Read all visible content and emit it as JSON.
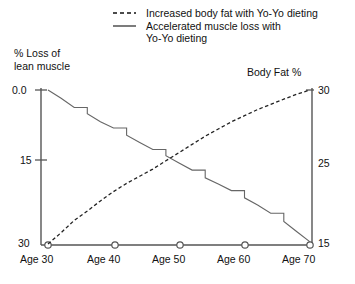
{
  "legend": {
    "position": "top",
    "entries": [
      {
        "label": "Increased body fat with Yo-Yo dieting",
        "style": "dashed",
        "name": "legend-item-body-fat"
      },
      {
        "label": "Accelerated muscle loss with",
        "label2": "Yo-Yo dieting",
        "style": "solid",
        "name": "legend-item-muscle-loss"
      }
    ]
  },
  "axes": {
    "left_title_line1": "% Loss of",
    "left_title_line2": "lean muscle",
    "right_title": "Body Fat %",
    "left_ticks": [
      "0.0",
      "15",
      "30"
    ],
    "right_ticks": [
      "30",
      "25",
      "15"
    ],
    "x_ticks": [
      "Age 30",
      "Age 40",
      "Age 50",
      "Age 60",
      "Age 70"
    ]
  },
  "chart_data": {
    "type": "line",
    "title": "",
    "subtitle": "",
    "xlabel": "",
    "ylabel": "% Loss of lean muscle",
    "y2label": "Body Fat %",
    "grid": false,
    "legend_position": "top",
    "x": [
      30,
      32,
      34,
      36,
      38,
      40,
      42,
      44,
      46,
      48,
      50,
      52,
      54,
      56,
      58,
      60,
      62,
      64,
      66,
      68,
      70
    ],
    "xlim": [
      30,
      70
    ],
    "ylim": [
      30,
      0
    ],
    "y2lim": [
      15,
      30
    ],
    "yticks": [
      0.0,
      15,
      30
    ],
    "y2ticks": [
      15,
      25,
      30
    ],
    "series": [
      {
        "name": "Accelerated muscle loss with Yo-Yo dieting",
        "axis": "left",
        "style": "solid",
        "ylabel": "% Loss of lean muscle",
        "values": [
          0.0,
          1.6,
          3.4,
          4.6,
          6.2,
          7.4,
          8.8,
          10.2,
          11.6,
          12.8,
          14.2,
          15.6,
          17.1,
          18.3,
          19.6,
          21.0,
          22.4,
          24.0,
          25.6,
          27.6,
          29.6
        ]
      },
      {
        "name": "Increased body fat with Yo-Yo dieting",
        "axis": "right",
        "style": "dashed",
        "ylabel": "Body Fat %",
        "values": [
          15.0,
          16.1,
          17.3,
          18.2,
          19.2,
          20.1,
          20.9,
          21.6,
          22.3,
          23.1,
          23.9,
          24.7,
          25.5,
          26.2,
          26.9,
          27.5,
          28.1,
          28.6,
          29.1,
          29.6,
          30.0
        ]
      }
    ]
  }
}
